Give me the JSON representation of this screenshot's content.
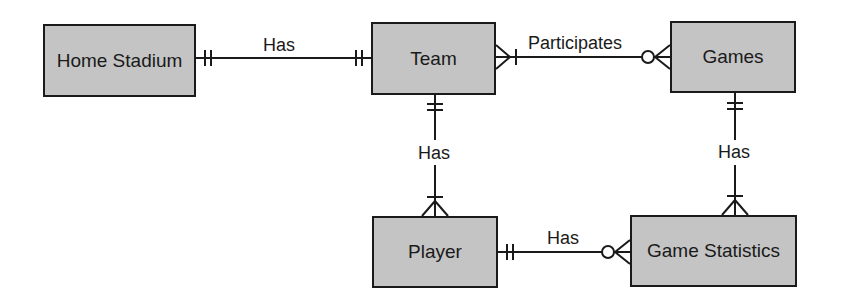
{
  "diagram": {
    "type": "entity-relationship",
    "notation": "crow's foot",
    "entities": [
      {
        "id": "home_stadium",
        "label": "Home Stadium",
        "box": [
          43,
          24,
          153,
          73
        ]
      },
      {
        "id": "team",
        "label": "Team",
        "box": [
          371,
          22,
          125,
          73
        ]
      },
      {
        "id": "games",
        "label": "Games",
        "box": [
          670,
          21,
          126,
          72
        ]
      },
      {
        "id": "player",
        "label": "Player",
        "box": [
          372,
          216,
          126,
          72
        ]
      },
      {
        "id": "game_statistics",
        "label": "Game Statistics",
        "box": [
          630,
          215,
          167,
          72
        ]
      }
    ],
    "relationships": [
      {
        "from": "home_stadium",
        "to": "team",
        "label": "Has",
        "from_card": "one-and-only-one",
        "to_card": "one-and-only-one"
      },
      {
        "from": "team",
        "to": "games",
        "label": "Participates",
        "from_card": "one-or-many",
        "to_card": "zero-or-many"
      },
      {
        "from": "team",
        "to": "player",
        "label": "Has",
        "from_card": "one-and-only-one",
        "to_card": "one-or-many"
      },
      {
        "from": "games",
        "to": "game_statistics",
        "label": "Has",
        "from_card": "one-and-only-one",
        "to_card": "one-or-many"
      },
      {
        "from": "player",
        "to": "game_statistics",
        "label": "Has",
        "from_card": "one-and-only-one",
        "to_card": "zero-or-many"
      }
    ]
  },
  "colors": {
    "entity_fill": "#c4c4c4",
    "stroke": "#1a1a1a"
  }
}
